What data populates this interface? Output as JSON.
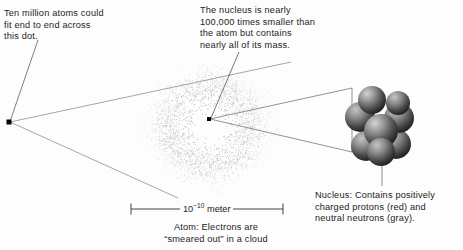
{
  "diagram": {
    "background_color": "#fdfdfd",
    "ink_color": "#1c1c1c",
    "line_color": "#555555"
  },
  "labels": {
    "dot_callout": "Ten million atoms could\nfit end to end across\nthis dot.",
    "nucleus_callout": "The nucleus is nearly\n100,000 times smaller than\nthe atom but contains\nnearly all of its mass.",
    "nucleus_caption": "Nucleus: Contains positively\ncharged protons (red) and\nneutral neutrons (gray).",
    "atom_caption": "Atom: Electrons are\n“smeared out” in a cloud"
  },
  "scale_bar": {
    "value_base": "10",
    "value_exponent": "−10",
    "unit": "meter",
    "full_label": "10⁻¹⁰ meter"
  },
  "nucleus_model": {
    "legend": [
      {
        "name": "proton",
        "color_name": "red"
      },
      {
        "name": "neutron",
        "color_name": "gray"
      }
    ],
    "sphere_count": 8,
    "sphere_light": "#c8c8c8",
    "sphere_dark": "#262626"
  },
  "electron_cloud": {
    "description": "stippled electron probability cloud",
    "center_x": 209,
    "center_y": 126,
    "radius_x": 76,
    "radius_y": 70,
    "dot_count": 2600
  },
  "markers": {
    "dot_left_x": 9,
    "dot_left_y": 122,
    "nucleus_point_x": 209,
    "nucleus_point_y": 119
  }
}
